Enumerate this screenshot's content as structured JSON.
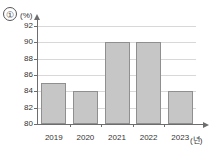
{
  "marker": {
    "label": "①"
  },
  "chart_data": {
    "type": "bar",
    "title": "",
    "subtitle": "",
    "categories": [
      "2019",
      "2020",
      "2021",
      "2022",
      "2023"
    ],
    "values": [
      85,
      84,
      90,
      90,
      84
    ],
    "series": [
      {
        "name": "",
        "values": [
          85,
          84,
          90,
          90,
          84
        ]
      }
    ],
    "xlabel": "(년)",
    "ylabel": "(%)",
    "ylim": [
      80,
      92
    ],
    "ytick_step": 2,
    "yticks": [
      80,
      82,
      84,
      86,
      88,
      90,
      92
    ],
    "ytick_labels": [
      "80",
      "82",
      "84",
      "86",
      "88",
      "90",
      "92"
    ],
    "grid": true,
    "grid_axis": "y",
    "legend": false,
    "legend_position": "none",
    "bar_fill_color": "#c6c6c6",
    "bar_border_color": "#8f8f8f",
    "gridline_color": "#d8d8d8",
    "axis_color": "#6d6d6d",
    "text_color": "#333333",
    "background_color": "#ffffff"
  }
}
